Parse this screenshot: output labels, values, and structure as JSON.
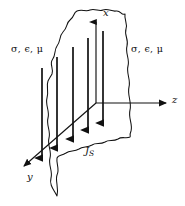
{
  "figure": {
    "background_color": "#ffffff",
    "stroke_color": "#111111",
    "labels": {
      "medium_left": "σ, ϵ, μ",
      "medium_right": "σ, ϵ, μ",
      "axis_x": "x",
      "axis_y": "y",
      "axis_z": "z",
      "current_symbol": "J",
      "current_subscript": "S"
    },
    "axes": [
      {
        "name": "x",
        "direction": "up",
        "origin": [
          96,
          103
        ],
        "tip": [
          96,
          20
        ]
      },
      {
        "name": "y",
        "direction": "down-left",
        "origin": [
          96,
          103
        ],
        "tip": [
          22,
          168
        ]
      },
      {
        "name": "z",
        "direction": "right",
        "origin": [
          96,
          103
        ],
        "tip": [
          169,
          103
        ]
      }
    ],
    "sheet": {
      "description": "irregular wavy-edged parallelogram lying in the x-y plane",
      "edge_style": "wavy",
      "corners": [
        [
          52,
          74
        ],
        [
          125,
          14
        ],
        [
          130,
          137
        ],
        [
          57,
          196
        ]
      ]
    },
    "current_arrows": {
      "count": 5,
      "direction": "downward",
      "quantity": "surface current density",
      "positions": [
        {
          "x": 42,
          "y_start": 68,
          "y_end": 162
        },
        {
          "x": 57,
          "y_start": 57,
          "y_end": 152
        },
        {
          "x": 73,
          "y_start": 47,
          "y_end": 143
        },
        {
          "x": 88,
          "y_start": 38,
          "y_end": 134
        },
        {
          "x": 103,
          "y_start": 31,
          "y_end": 127
        }
      ]
    }
  }
}
